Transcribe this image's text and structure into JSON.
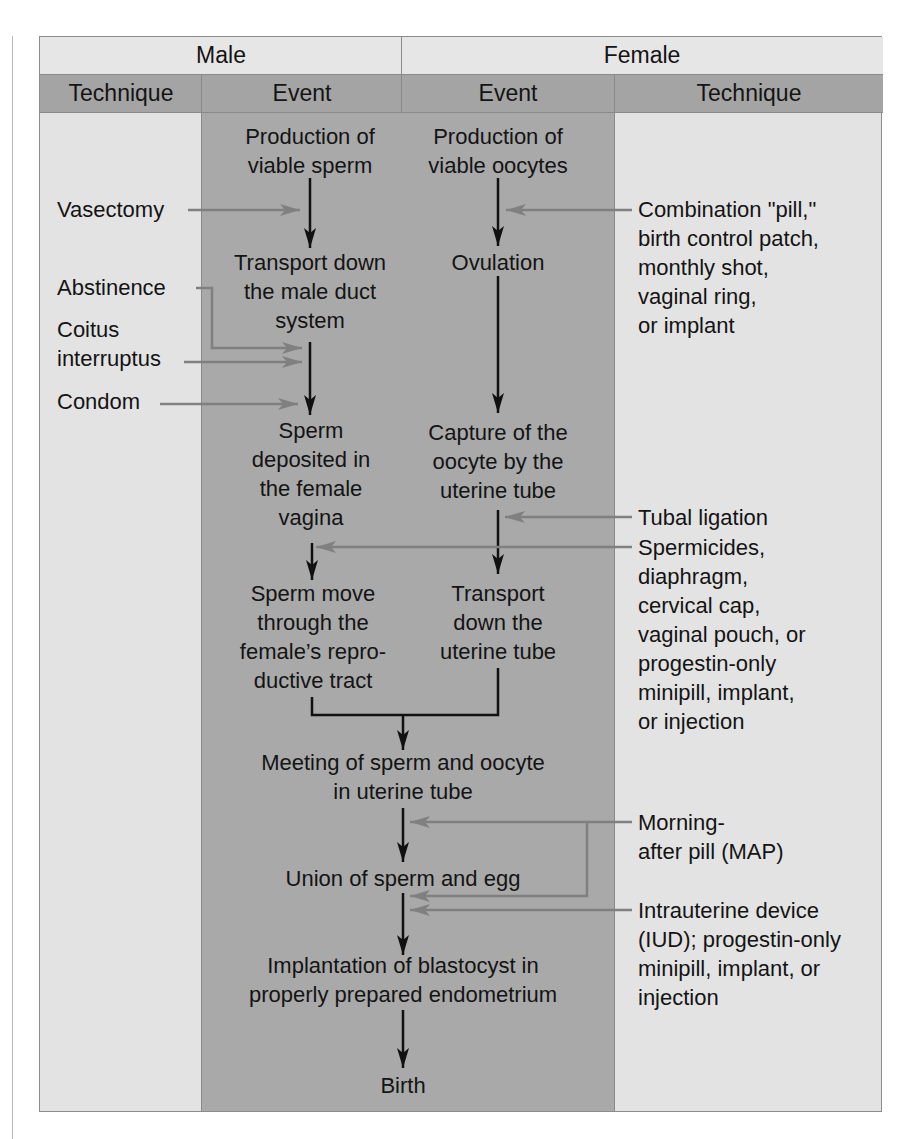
{
  "header": {
    "male": "Male",
    "female": "Female",
    "columns": [
      "Technique",
      "Event",
      "Event",
      "Technique"
    ]
  },
  "male_events": [
    "Production of\nviable sperm",
    "Transport down\nthe male duct\nsystem",
    "Sperm\ndeposited in\nthe female\nvagina",
    "Sperm move\nthrough the\nfemale’s repro-\nductive tract"
  ],
  "female_events": [
    "Production of\nviable oocytes",
    "Ovulation",
    "Capture of the\noocyte by the\nuterine tube",
    "Transport\ndown the\nuterine tube"
  ],
  "shared_events": [
    "Meeting of sperm and oocyte\nin uterine tube",
    "Union of sperm and egg",
    "Implantation of blastocyst in\nproperly prepared endometrium",
    "Birth"
  ],
  "male_techniques": [
    "Vasectomy",
    "Abstinence",
    "Coitus\ninterruptus",
    "Condom"
  ],
  "female_techniques": [
    "Combination \"pill,\"\nbirth control patch,\nmonthly shot,\nvaginal ring,\nor implant",
    "Tubal ligation",
    "Spermicides,\ndiaphragm,\ncervical cap,\nvaginal pouch, or\nprogestin-only\nminipill, implant,\nor injection",
    "Morning-\nafter pill (MAP)",
    "Intrauterine device\n(IUD); progestin-only\nminipill, implant, or\ninjection"
  ],
  "colors": {
    "header_light": "#e6e6e6",
    "header_dark": "#a4a4a4",
    "technique_column": "#e3e3e3",
    "event_column": "#a9a9a9",
    "event_arrow": "#111111",
    "technique_arrow": "#7f7f7f"
  }
}
